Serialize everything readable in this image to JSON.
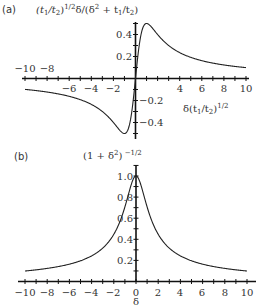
{
  "chart_data": [
    {
      "panel": "(a)",
      "type": "line",
      "title": "(t1/t2)^1/2 δ/(δ² + t1/t2)",
      "xlabel": "δ(t1/t2)^1/2",
      "ylabel": "(t1/t2)^1/2 δ/(δ² + t1/t2)",
      "xlim": [
        -10,
        10
      ],
      "ylim": [
        -0.5,
        0.5
      ],
      "x_tick_labels": [
        "-10",
        "-8",
        "-6",
        "-4",
        "-2",
        "4",
        "6",
        "8",
        "10"
      ],
      "y_tick_labels": [
        "0.4",
        "0.2",
        "-0.2",
        "-0.4"
      ],
      "grid": false,
      "series": [
        {
          "name": "x/(1+x^2)",
          "x": [
            -10,
            -8,
            -6,
            -4,
            -2,
            -1,
            0,
            1,
            2,
            4,
            6,
            8,
            10
          ],
          "y": [
            -0.099,
            -0.123,
            -0.162,
            -0.235,
            -0.4,
            -0.5,
            0,
            0.5,
            0.4,
            0.235,
            0.162,
            0.123,
            0.099
          ]
        }
      ]
    },
    {
      "panel": "(b)",
      "type": "line",
      "title": "(1 + δ²)^-1/2",
      "xlabel": "δ",
      "ylabel": "(1 + δ²)^-1/2",
      "xlim": [
        -10,
        10
      ],
      "ylim": [
        0,
        1.0
      ],
      "x_tick_labels": [
        "-10",
        "-8",
        "-6",
        "-4",
        "-2",
        "0",
        "2",
        "4",
        "6",
        "8",
        "10"
      ],
      "y_tick_labels": [
        "1.0",
        "0.8",
        "0.6",
        "0.4",
        "0.2"
      ],
      "grid": false,
      "series": [
        {
          "name": "1/sqrt(1+x^2)",
          "x": [
            -10,
            -8,
            -6,
            -4,
            -2,
            -1,
            0,
            1,
            2,
            4,
            6,
            8,
            10
          ],
          "y": [
            0.0995,
            0.124,
            0.164,
            0.243,
            0.447,
            0.707,
            1.0,
            0.707,
            0.447,
            0.243,
            0.164,
            0.124,
            0.0995
          ]
        }
      ]
    }
  ],
  "labels": {
    "panel_a": "(a)",
    "panel_b": "(b)",
    "a_title_1": "(t",
    "a_title_sub1": "1",
    "a_title_2": "/t",
    "a_title_sub2": "2",
    "a_title_3": ")",
    "a_title_sup": "1/2",
    "a_title_4": "δ/(δ",
    "a_title_sup2": "2",
    "a_title_5": " + t",
    "a_title_sub3": "1",
    "a_title_6": "/t",
    "a_title_sub4": "2",
    "a_title_7": ")",
    "a_xlabel_1": "δ(t",
    "a_xlabel_sub1": "1",
    "a_xlabel_2": "/t",
    "a_xlabel_sub2": "2",
    "a_xlabel_3": ")",
    "a_xlabel_sup": "1/2",
    "b_title_1": "(1 + δ",
    "b_title_sup1": "2",
    "b_title_2": ")",
    "b_title_sup2": " −1/2",
    "b_xlabel": "δ"
  },
  "ticks_a": {
    "x": [
      {
        "label": "−10",
        "x": 25,
        "y": 72
      },
      {
        "label": "−8",
        "x": 47,
        "y": 72
      },
      {
        "label": "−6",
        "x": 69,
        "y": 92
      },
      {
        "label": "−4",
        "x": 91,
        "y": 92
      },
      {
        "label": "−2",
        "x": 113,
        "y": 92
      },
      {
        "label": "4",
        "x": 180,
        "y": 92
      },
      {
        "label": "6",
        "x": 202,
        "y": 92
      },
      {
        "label": "8",
        "x": 224,
        "y": 92
      },
      {
        "label": "10",
        "x": 246,
        "y": 92
      }
    ],
    "y": [
      {
        "label": "0.4",
        "x": 132,
        "y": 38
      },
      {
        "label": "0.2",
        "x": 132,
        "y": 60
      },
      {
        "label": "−0.2",
        "x": 139,
        "y": 104
      },
      {
        "label": "−0.4",
        "x": 139,
        "y": 126
      }
    ]
  },
  "ticks_b": {
    "x": [
      {
        "label": "−10",
        "x": 25
      },
      {
        "label": "−8",
        "x": 47
      },
      {
        "label": "−6",
        "x": 69
      },
      {
        "label": "−4",
        "x": 91
      },
      {
        "label": "−2",
        "x": 113
      },
      {
        "label": "0",
        "x": 136
      },
      {
        "label": "2",
        "x": 158
      },
      {
        "label": "4",
        "x": 180
      },
      {
        "label": "6",
        "x": 202
      },
      {
        "label": "8",
        "x": 225
      },
      {
        "label": "10",
        "x": 247
      }
    ],
    "y": [
      {
        "label": "1.0",
        "y": 176
      },
      {
        "label": "0.8",
        "y": 197
      },
      {
        "label": "0.6",
        "y": 218
      },
      {
        "label": "0.4",
        "y": 239
      },
      {
        "label": "0.2",
        "y": 260
      }
    ]
  }
}
